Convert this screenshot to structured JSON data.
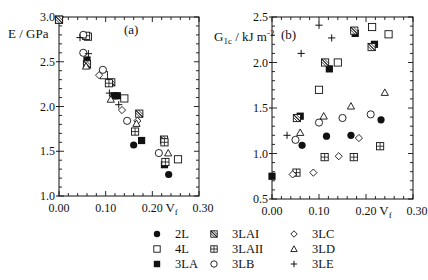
{
  "chart_data": [
    {
      "type": "scatter",
      "panel_label": "(a)",
      "xlabel": "V_f",
      "xlabel_main": "V",
      "xlabel_sub": "f",
      "ylabel": "E / GPa",
      "xlim": [
        0.0,
        0.3
      ],
      "ylim": [
        1.0,
        3.0
      ],
      "xticks": [
        "0.00",
        "0.10",
        "0.20",
        "0.30"
      ],
      "yticks": [
        "1.0",
        "1.5",
        "2.0",
        "2.5",
        "3.0"
      ],
      "grid": false,
      "series": [
        {
          "name": "2L",
          "marker": "filled-circle",
          "points": [
            [
              0.0,
              2.97
            ],
            [
              0.06,
              2.5
            ],
            [
              0.16,
              1.57
            ],
            [
              0.235,
              1.24
            ]
          ]
        },
        {
          "name": "4L",
          "marker": "open-square",
          "points": [
            [
              0.0,
              2.97
            ],
            [
              0.062,
              2.78
            ],
            [
              0.096,
              2.35
            ],
            [
              0.14,
              2.09
            ],
            [
              0.255,
              1.41
            ]
          ]
        },
        {
          "name": "3LA",
          "marker": "filled-square",
          "points": [
            [
              0.0,
              2.97
            ],
            [
              0.06,
              2.52
            ],
            [
              0.118,
              2.12
            ],
            [
              0.125,
              2.12
            ],
            [
              0.177,
              1.62
            ],
            [
              0.226,
              1.35
            ]
          ]
        },
        {
          "name": "3LAI",
          "marker": "hatched-square",
          "points": [
            [
              0.0,
              2.97
            ],
            [
              0.06,
              2.47
            ],
            [
              0.112,
              2.27
            ],
            [
              0.172,
              1.92
            ],
            [
              0.225,
              1.63
            ]
          ]
        },
        {
          "name": "3LAII",
          "marker": "crossed-square",
          "points": [
            [
              0.058,
              2.79
            ],
            [
              0.107,
              2.26
            ],
            [
              0.163,
              1.72
            ],
            [
              0.226,
              1.6
            ],
            [
              0.228,
              1.38
            ]
          ]
        },
        {
          "name": "3LB",
          "marker": "open-circle",
          "points": [
            [
              0.052,
              2.8
            ],
            [
              0.052,
              2.6
            ],
            [
              0.094,
              2.41
            ],
            [
              0.146,
              1.84
            ],
            [
              0.214,
              1.48
            ]
          ]
        },
        {
          "name": "3LC",
          "marker": "open-diamond",
          "points": [
            [
              0.086,
              2.35
            ],
            [
              0.135,
              1.96
            ],
            [
              0.168,
              1.84
            ]
          ]
        },
        {
          "name": "3LD",
          "marker": "open-triangle",
          "points": [
            [
              0.058,
              2.45
            ],
            [
              0.111,
              2.08
            ],
            [
              0.166,
              1.81
            ],
            [
              0.234,
              1.48
            ]
          ]
        },
        {
          "name": "3LE",
          "marker": "plus",
          "points": [
            [
              0.045,
              2.77
            ],
            [
              0.063,
              2.59
            ],
            [
              0.108,
              2.15
            ],
            [
              0.128,
              2.02
            ]
          ]
        }
      ]
    },
    {
      "type": "scatter",
      "panel_label": "(b)",
      "xlabel": "V_f",
      "xlabel_main": "V",
      "xlabel_sub": "f",
      "ylabel": "G_1c / kJ m^-2",
      "ylabel_main": "G",
      "ylabel_sub": "1c",
      "ylabel_rest": " / kJ m",
      "ylabel_sup": "-2",
      "xlim": [
        0.0,
        0.3
      ],
      "ylim": [
        0.5,
        2.5
      ],
      "xticks": [
        "0.00",
        "0.10",
        "0.20",
        "0.30"
      ],
      "yticks": [
        "0.5",
        "1.0",
        "1.5",
        "2.0",
        "2.5"
      ],
      "grid": false,
      "series": [
        {
          "name": "2L",
          "marker": "filled-circle",
          "points": [
            [
              0.064,
              1.09
            ],
            [
              0.116,
              1.19
            ],
            [
              0.168,
              1.2
            ],
            [
              0.232,
              1.37
            ]
          ]
        },
        {
          "name": "4L",
          "marker": "open-square",
          "points": [
            [
              0.1,
              1.7
            ],
            [
              0.14,
              2.0
            ],
            [
              0.213,
              2.39
            ],
            [
              0.248,
              2.31
            ]
          ]
        },
        {
          "name": "3LA",
          "marker": "filled-square",
          "points": [
            [
              0.0,
              0.75
            ],
            [
              0.06,
              1.41
            ],
            [
              0.122,
              1.93
            ],
            [
              0.177,
              2.32
            ],
            [
              0.218,
              2.2
            ]
          ]
        },
        {
          "name": "3LAI",
          "marker": "hatched-square",
          "points": [
            [
              0.053,
              1.39
            ],
            [
              0.113,
              2.0
            ],
            [
              0.175,
              2.35
            ],
            [
              0.212,
              2.17
            ]
          ]
        },
        {
          "name": "3LAII",
          "marker": "crossed-square",
          "points": [
            [
              0.052,
              0.79
            ],
            [
              0.112,
              0.96
            ],
            [
              0.174,
              0.96
            ],
            [
              0.23,
              1.08
            ]
          ]
        },
        {
          "name": "3LB",
          "marker": "open-circle",
          "points": [
            [
              0.05,
              1.15
            ],
            [
              0.1,
              1.34
            ],
            [
              0.15,
              1.39
            ],
            [
              0.21,
              1.43
            ]
          ]
        },
        {
          "name": "3LC",
          "marker": "open-diamond",
          "points": [
            [
              0.044,
              0.77
            ],
            [
              0.088,
              0.79
            ],
            [
              0.142,
              0.97
            ],
            [
              0.185,
              1.17
            ]
          ]
        },
        {
          "name": "3LD",
          "marker": "open-triangle",
          "points": [
            [
              0.06,
              1.23
            ],
            [
              0.11,
              1.41
            ],
            [
              0.168,
              1.52
            ],
            [
              0.24,
              1.67
            ]
          ]
        },
        {
          "name": "3LE",
          "marker": "plus",
          "points": [
            [
              0.032,
              1.2
            ],
            [
              0.062,
              2.1
            ],
            [
              0.1,
              2.41
            ],
            [
              0.127,
              2.27
            ]
          ]
        }
      ]
    }
  ],
  "legend": {
    "position": "bottom",
    "columns": [
      [
        {
          "name": "2L",
          "marker": "filled-circle"
        },
        {
          "name": "4L",
          "marker": "open-square"
        },
        {
          "name": "3LA",
          "marker": "filled-square"
        }
      ],
      [
        {
          "name": "3LAI",
          "marker": "hatched-square"
        },
        {
          "name": "3LAII",
          "marker": "crossed-square"
        },
        {
          "name": "3LB",
          "marker": "open-circle"
        }
      ],
      [
        {
          "name": "3LC",
          "marker": "open-diamond"
        },
        {
          "name": "3LD",
          "marker": "open-triangle"
        },
        {
          "name": "3LE",
          "marker": "plus"
        }
      ]
    ]
  }
}
